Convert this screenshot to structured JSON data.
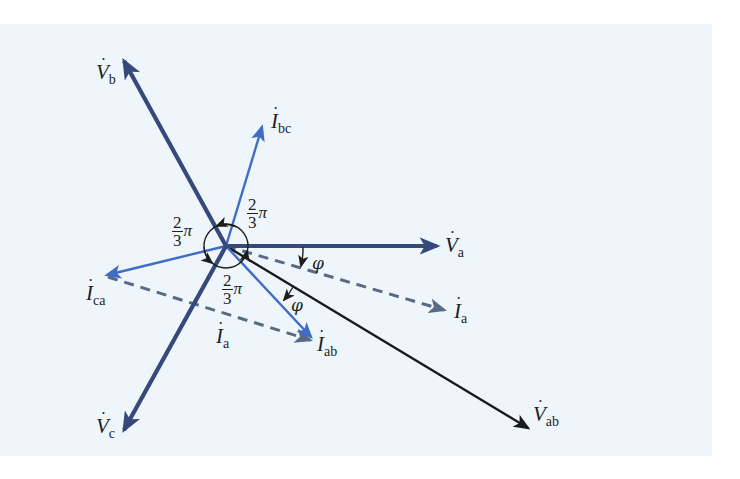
{
  "diagram": {
    "background_color": "#eef6fb",
    "colors": {
      "voltage_phase": "#35497a",
      "line_voltage": "#1a1a1a",
      "phase_current": "#3f6cc8",
      "line_current_dashed": "#5a6a85",
      "annotation": "#1e1e1e"
    },
    "origin": {
      "x": 226,
      "y": 246
    },
    "phasors": [
      {
        "id": "Vb",
        "label_main": "V",
        "label_sub": "b",
        "tip": {
          "x": 122,
          "y": 58
        },
        "style": "voltage"
      },
      {
        "id": "Vc",
        "label_main": "V",
        "label_sub": "c",
        "tip": {
          "x": 122,
          "y": 433
        },
        "style": "voltage"
      },
      {
        "id": "Va",
        "label_main": "V",
        "label_sub": "a",
        "tip": {
          "x": 440,
          "y": 246
        },
        "style": "voltage"
      },
      {
        "id": "Vab",
        "label_main": "V",
        "label_sub": "ab",
        "tip": {
          "x": 530,
          "y": 429
        },
        "style": "line-voltage"
      },
      {
        "id": "Ibc",
        "label_main": "I",
        "label_sub": "bc",
        "tip": {
          "x": 263,
          "y": 124
        },
        "style": "current"
      },
      {
        "id": "Ica",
        "label_main": "I",
        "label_sub": "ca",
        "tip": {
          "x": 105,
          "y": 276
        },
        "style": "current"
      },
      {
        "id": "Iab",
        "label_main": "I",
        "label_sub": "ab",
        "tip": {
          "x": 313,
          "y": 339
        },
        "style": "current"
      },
      {
        "id": "Ia_right",
        "label_main": "I",
        "label_sub": "a",
        "tip": {
          "x": 446,
          "y": 311
        },
        "style": "dashed"
      },
      {
        "id": "Ia_lower",
        "label_main": "I",
        "label_sub": "a",
        "from": {
          "x": 105,
          "y": 276
        },
        "tip": {
          "x": 312,
          "y": 341
        },
        "style": "dashed"
      }
    ],
    "angle_labels": [
      {
        "id": "angle-upper",
        "numerator": "2",
        "denominator": "3",
        "symbol": "π"
      },
      {
        "id": "angle-left",
        "numerator": "2",
        "denominator": "3",
        "symbol": "π"
      },
      {
        "id": "angle-lower",
        "numerator": "2",
        "denominator": "3",
        "symbol": "π"
      }
    ],
    "phi_labels": [
      {
        "id": "phi-upper",
        "symbol": "φ"
      },
      {
        "id": "phi-lower",
        "symbol": "φ"
      }
    ],
    "dot": "·"
  }
}
